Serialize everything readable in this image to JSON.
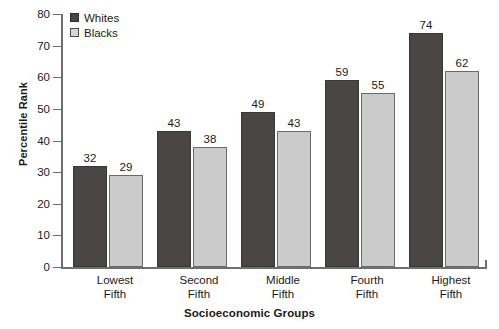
{
  "chart_data": {
    "type": "bar",
    "title": "",
    "xlabel": "Socioeconomic Groups",
    "ylabel": "Percentile Rank",
    "categories": [
      "Lowest Fifth",
      "Second Fifth",
      "Middle Fifth",
      "Fourth Fifth",
      "Highest Fifth"
    ],
    "category_lines": [
      [
        "Lowest",
        "Fifth"
      ],
      [
        "Second",
        "Fifth"
      ],
      [
        "Middle",
        "Fifth"
      ],
      [
        "Fourth",
        "Fifth"
      ],
      [
        "Highest",
        "Fifth"
      ]
    ],
    "series": [
      {
        "name": "Whites",
        "color": "#4a4646",
        "values": [
          32,
          43,
          49,
          59,
          74
        ]
      },
      {
        "name": "Blacks",
        "color": "#cbcbcb",
        "values": [
          29,
          38,
          43,
          55,
          62
        ]
      }
    ],
    "ylim": [
      0,
      80
    ],
    "yticks": [
      0,
      10,
      20,
      30,
      40,
      50,
      60,
      70,
      80
    ],
    "ytick_labels": [
      "0",
      "10",
      "20",
      "30",
      "40",
      "50",
      "60",
      "70",
      "80"
    ],
    "grid": false,
    "legend_position": "top-left",
    "data_labels": true
  },
  "legend": {
    "items": [
      {
        "label": "Whites"
      },
      {
        "label": "Blacks"
      }
    ]
  },
  "axes": {
    "y_title": "Percentile Rank",
    "x_title": "Socioeconomic Groups"
  }
}
